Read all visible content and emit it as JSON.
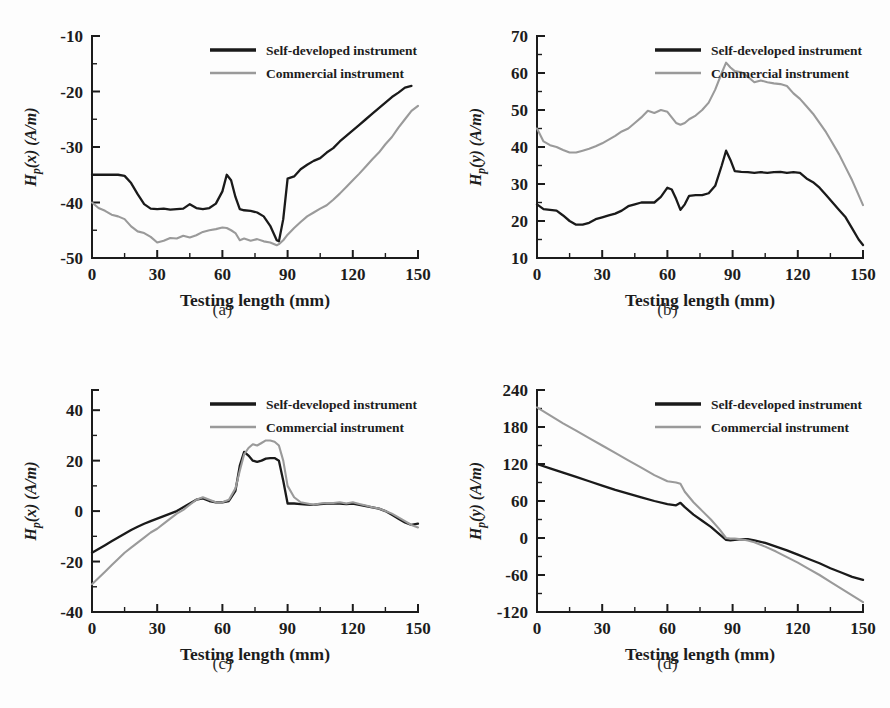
{
  "figure": {
    "background": "#fdfdfd",
    "panel_captions": [
      "(a)",
      "(b)",
      "(c)",
      "(d)"
    ],
    "colors": {
      "self_developed": "#1a1a1a",
      "commercial": "#9a9a9a",
      "axis": "#1c1c1c"
    }
  },
  "legend": {
    "self_label": "Self-developed instrument",
    "commercial_label": "Commercial instrument"
  },
  "chart_data": [
    {
      "id": "a",
      "type": "line",
      "caption": "(a)",
      "title": "",
      "xlabel": "Testing length (mm)",
      "ylabel": "Hₚ(x) (A/m)",
      "ylabel_parts": {
        "main": "H",
        "sub": "p",
        "rest": "(x) (A/m)"
      },
      "xlim": [
        0,
        150
      ],
      "ylim": [
        -50,
        -10
      ],
      "xticks": [
        0,
        30,
        60,
        90,
        120,
        150
      ],
      "yticks": [
        -50,
        -40,
        -30,
        -20,
        -10
      ],
      "x_minor_step": 15,
      "y_minor_step": 5,
      "grid": false,
      "legend_position": "top-right",
      "x": [
        0,
        3,
        6,
        9,
        12,
        15,
        18,
        21,
        24,
        27,
        30,
        33,
        36,
        39,
        42,
        45,
        48,
        51,
        54,
        57,
        60,
        62,
        64,
        66,
        68,
        70,
        73,
        76,
        79,
        82,
        85,
        86,
        88,
        90,
        93,
        96,
        99,
        102,
        105,
        108,
        111,
        114,
        117,
        120,
        123,
        126,
        129,
        132,
        135,
        138,
        141,
        144,
        147,
        150
      ],
      "series": [
        {
          "name": "Self-developed instrument",
          "color": "#1a1a1a",
          "values": [
            -35.0,
            -35.0,
            -35.0,
            -35.0,
            -35.0,
            -35.2,
            -36.5,
            -38.5,
            -40.3,
            -41.1,
            -41.2,
            -41.1,
            -41.3,
            -41.2,
            -41.1,
            -40.3,
            -41.0,
            -41.2,
            -41.0,
            -40.2,
            -38.0,
            -35.0,
            -36.0,
            -39.0,
            -41.2,
            -41.4,
            -41.5,
            -41.8,
            -42.5,
            -44.2,
            -46.8,
            -47.0,
            -43.0,
            -35.7,
            -35.3,
            -34.0,
            -33.2,
            -32.5,
            -32.0,
            -31.0,
            -30.2,
            -29.0,
            -28.0,
            -27.0,
            -26.0,
            -25.0,
            -24.0,
            -23.0,
            -22.0,
            -21.0,
            -20.2,
            -19.3,
            -19.0,
            null
          ]
        },
        {
          "name": "Commercial instrument",
          "color": "#9a9a9a",
          "values": [
            -40.0,
            -41.0,
            -41.5,
            -42.2,
            -42.5,
            -43.0,
            -44.3,
            -45.2,
            -45.5,
            -46.2,
            -47.2,
            -46.9,
            -46.4,
            -46.5,
            -46.0,
            -46.3,
            -45.9,
            -45.3,
            -45.0,
            -44.8,
            -44.5,
            -44.6,
            -45.0,
            -45.5,
            -46.8,
            -46.5,
            -46.9,
            -46.6,
            -47.0,
            -47.2,
            -47.7,
            -47.5,
            -46.8,
            -45.8,
            -44.6,
            -43.5,
            -42.5,
            -41.8,
            -41.1,
            -40.5,
            -39.5,
            -38.4,
            -37.2,
            -36.0,
            -34.8,
            -33.5,
            -32.2,
            -31.0,
            -29.5,
            -28.2,
            -26.5,
            -25.0,
            -23.5,
            -22.6
          ]
        }
      ]
    },
    {
      "id": "b",
      "type": "line",
      "caption": "(b)",
      "title": "",
      "xlabel": "Testing length (mm)",
      "ylabel": "Hₚ(y) (A/m)",
      "ylabel_parts": {
        "main": "H",
        "sub": "p",
        "rest": "(y) (A/m)"
      },
      "xlim": [
        0,
        150
      ],
      "ylim": [
        10,
        70
      ],
      "xticks": [
        0,
        30,
        60,
        90,
        120,
        150
      ],
      "yticks": [
        10,
        20,
        30,
        40,
        50,
        60,
        70
      ],
      "x_minor_step": 15,
      "y_minor_step": 5,
      "grid": false,
      "legend_position": "top-right",
      "x": [
        0,
        3,
        6,
        9,
        12,
        15,
        18,
        21,
        24,
        27,
        30,
        33,
        36,
        39,
        42,
        45,
        48,
        51,
        54,
        57,
        60,
        62,
        64,
        66,
        68,
        70,
        73,
        76,
        79,
        82,
        85,
        87,
        89,
        91,
        94,
        97,
        100,
        103,
        106,
        109,
        112,
        115,
        118,
        121,
        124,
        127,
        130,
        133,
        136,
        139,
        142,
        145,
        148,
        150
      ],
      "series": [
        {
          "name": "Self-developed instrument",
          "color": "#1a1a1a",
          "values": [
            24.5,
            23.2,
            23.0,
            22.8,
            21.5,
            20.0,
            19.0,
            19.0,
            19.5,
            20.5,
            21.0,
            21.5,
            22.0,
            22.8,
            24.0,
            24.5,
            25.0,
            25.0,
            25.0,
            26.5,
            29.0,
            28.5,
            26.0,
            23.0,
            24.5,
            26.8,
            27.0,
            27.0,
            27.5,
            29.5,
            35.0,
            39.0,
            36.5,
            33.5,
            33.3,
            33.2,
            33.0,
            33.2,
            33.0,
            33.2,
            33.3,
            33.0,
            33.2,
            33.0,
            31.5,
            30.5,
            29.0,
            27.0,
            25.0,
            23.0,
            21.0,
            18.0,
            15.0,
            13.5
          ]
        },
        {
          "name": "Commercial instrument",
          "color": "#9a9a9a",
          "values": [
            45.0,
            41.5,
            40.5,
            40.0,
            39.2,
            38.5,
            38.5,
            39.0,
            39.5,
            40.2,
            41.0,
            42.0,
            43.0,
            44.2,
            45.0,
            46.5,
            48.0,
            49.8,
            49.2,
            50.0,
            49.5,
            48.0,
            46.5,
            46.0,
            46.5,
            47.5,
            48.5,
            50.0,
            52.0,
            55.5,
            60.0,
            62.8,
            61.5,
            60.5,
            60.2,
            59.0,
            57.5,
            58.0,
            57.5,
            57.2,
            57.0,
            56.5,
            54.5,
            53.0,
            51.0,
            49.0,
            46.5,
            44.0,
            41.0,
            38.0,
            34.5,
            31.0,
            27.0,
            24.3
          ]
        }
      ]
    },
    {
      "id": "c",
      "type": "line",
      "caption": "(c)",
      "title": "",
      "xlabel": "Testing length (mm)",
      "ylabel": "Hₚ(x) (A/m)",
      "ylabel_parts": {
        "main": "H",
        "sub": "p",
        "rest": "(x) (A/m)"
      },
      "xlim": [
        0,
        150
      ],
      "ylim": [
        -40,
        48
      ],
      "xticks": [
        0,
        30,
        60,
        90,
        120,
        150
      ],
      "yticks": [
        -40,
        -20,
        0,
        20,
        40
      ],
      "x_minor_step": 15,
      "y_minor_step": 10,
      "grid": false,
      "legend_position": "top-right",
      "x": [
        0,
        3,
        6,
        9,
        12,
        15,
        18,
        21,
        24,
        27,
        30,
        33,
        36,
        39,
        42,
        45,
        48,
        51,
        54,
        57,
        60,
        63,
        66,
        68,
        70,
        72,
        74,
        76,
        78,
        80,
        82,
        84,
        86,
        88,
        90,
        93,
        96,
        99,
        102,
        105,
        108,
        111,
        114,
        117,
        120,
        123,
        126,
        129,
        132,
        135,
        138,
        141,
        144,
        147,
        150
      ],
      "series": [
        {
          "name": "Self-developed instrument",
          "color": "#1a1a1a",
          "values": [
            -16.5,
            -15.0,
            -13.5,
            -12.0,
            -10.5,
            -9.0,
            -7.5,
            -6.2,
            -5.0,
            -4.0,
            -3.0,
            -2.0,
            -1.0,
            0.0,
            1.5,
            3.0,
            4.5,
            5.0,
            4.0,
            3.5,
            3.5,
            4.0,
            8.0,
            18.0,
            23.5,
            22.0,
            20.0,
            19.5,
            20.0,
            20.8,
            21.0,
            21.0,
            20.0,
            12.0,
            3.0,
            3.0,
            2.8,
            2.6,
            2.5,
            2.8,
            3.0,
            3.0,
            3.0,
            2.8,
            3.0,
            2.5,
            2.0,
            1.5,
            1.0,
            0.0,
            -1.5,
            -3.0,
            -4.5,
            -5.5,
            -5.0
          ]
        },
        {
          "name": "Commercial instrument",
          "color": "#9a9a9a",
          "values": [
            -29.0,
            -26.5,
            -24.0,
            -21.5,
            -19.0,
            -16.5,
            -14.5,
            -12.5,
            -10.5,
            -8.5,
            -7.0,
            -5.0,
            -3.0,
            -1.0,
            0.5,
            2.5,
            4.5,
            5.5,
            4.5,
            3.5,
            3.5,
            4.5,
            9.0,
            16.0,
            22.5,
            25.0,
            26.5,
            26.0,
            27.0,
            28.0,
            28.0,
            27.5,
            26.0,
            20.0,
            10.0,
            5.5,
            3.5,
            3.0,
            2.5,
            3.0,
            3.2,
            3.2,
            3.5,
            3.0,
            3.5,
            2.8,
            2.2,
            1.5,
            1.0,
            0.0,
            -1.0,
            -2.5,
            -4.0,
            -5.5,
            -6.5
          ]
        }
      ]
    },
    {
      "id": "d",
      "type": "line",
      "caption": "(d)",
      "title": "",
      "xlabel": "Testing length (mm)",
      "ylabel": "Hₚ(y) (A/m)",
      "ylabel_parts": {
        "main": "H",
        "sub": "p",
        "rest": "(y) (A/m)"
      },
      "xlim": [
        0,
        150
      ],
      "ylim": [
        -120,
        240
      ],
      "xticks": [
        0,
        30,
        60,
        90,
        120,
        150
      ],
      "yticks": [
        -120,
        -60,
        0,
        60,
        120,
        180,
        240
      ],
      "x_minor_step": 15,
      "y_minor_step": 30,
      "grid": false,
      "legend_position": "top-right",
      "x": [
        0,
        6,
        12,
        18,
        24,
        30,
        36,
        42,
        48,
        54,
        60,
        64,
        66,
        68,
        72,
        76,
        80,
        84,
        87,
        89,
        91,
        94,
        97,
        100,
        105,
        110,
        115,
        120,
        125,
        130,
        135,
        140,
        145,
        150
      ],
      "series": [
        {
          "name": "Self-developed instrument",
          "color": "#1a1a1a",
          "values": [
            120,
            113,
            106,
            99,
            92,
            85,
            78,
            72,
            66,
            60,
            55,
            53,
            57,
            50,
            38,
            28,
            18,
            6,
            -3,
            -4,
            -3,
            -2,
            -2,
            -4,
            -8,
            -14,
            -20,
            -27,
            -34,
            -41,
            -49,
            -56,
            -63,
            -68
          ]
        },
        {
          "name": "Commercial instrument",
          "color": "#9a9a9a",
          "values": [
            212,
            199,
            186,
            174,
            162,
            150,
            138,
            126,
            114,
            102,
            92,
            90,
            88,
            75,
            58,
            44,
            30,
            14,
            0,
            -1,
            -1,
            -2,
            -4,
            -7,
            -14,
            -22,
            -31,
            -40,
            -50,
            -60,
            -71,
            -82,
            -93,
            -104
          ]
        }
      ]
    }
  ]
}
